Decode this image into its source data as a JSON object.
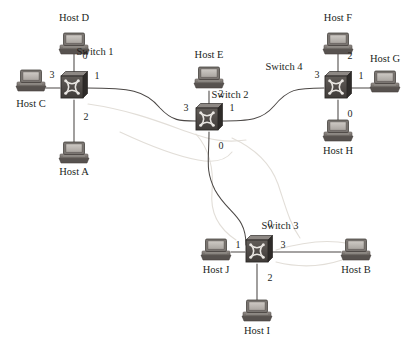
{
  "diagram": {
    "type": "network-topology",
    "colors": {
      "background": "#ffffff",
      "link": "#4b4745",
      "ghost_link": "#dedad4",
      "switch_face": "#55504d",
      "switch_top": "#8d8884",
      "switch_side": "#2e2b29",
      "switch_port_dot": "#e9e6e2",
      "host_screen_frame": "#6f6a66",
      "host_screen_fill": "#b9b4af",
      "host_base": "#8a8480",
      "host_base_shadow": "#57524f",
      "text": "#231f1d"
    },
    "switches": [
      {
        "id": "switch1",
        "label": "Switch 1",
        "x": 72,
        "y": 87,
        "label_x": 95,
        "label_y": 52
      },
      {
        "id": "switch2",
        "label": "Switch 2",
        "x": 207,
        "y": 119,
        "label_x": 230,
        "label_y": 95
      },
      {
        "id": "switch3",
        "label": "Switch 3",
        "x": 257,
        "y": 251,
        "label_x": 280,
        "label_y": 226
      },
      {
        "id": "switch4",
        "label": "Switch 4",
        "x": 336,
        "y": 87,
        "label_x": 284,
        "label_y": 67
      }
    ],
    "hosts": [
      {
        "id": "hostD",
        "label": "Host D",
        "x": 74,
        "y": 44,
        "label_x": 74,
        "label_y": 18,
        "orient": "down"
      },
      {
        "id": "hostC",
        "label": "Host C",
        "x": 31,
        "y": 81,
        "label_x": 31,
        "label_y": 104,
        "orient": "right"
      },
      {
        "id": "hostA",
        "label": "Host A",
        "x": 74,
        "y": 153,
        "label_x": 74,
        "label_y": 172,
        "orient": "up"
      },
      {
        "id": "hostE",
        "label": "Host E",
        "x": 209,
        "y": 78,
        "label_x": 209,
        "label_y": 55,
        "orient": "down"
      },
      {
        "id": "hostF",
        "label": "Host F",
        "x": 338,
        "y": 44,
        "label_x": 338,
        "label_y": 18,
        "orient": "down"
      },
      {
        "id": "hostG",
        "label": "Host G",
        "x": 385,
        "y": 82,
        "label_x": 385,
        "label_y": 59,
        "orient": "left"
      },
      {
        "id": "hostH",
        "label": "Host H",
        "x": 338,
        "y": 131,
        "label_x": 338,
        "label_y": 151,
        "orient": "up"
      },
      {
        "id": "hostJ",
        "label": "Host J",
        "x": 216,
        "y": 250,
        "label_x": 216,
        "label_y": 270,
        "orient": "right"
      },
      {
        "id": "hostB",
        "label": "Host B",
        "x": 356,
        "y": 250,
        "label_x": 356,
        "label_y": 270,
        "orient": "left"
      },
      {
        "id": "hostI",
        "label": "Host I",
        "x": 257,
        "y": 311,
        "label_x": 257,
        "label_y": 331,
        "orient": "up"
      }
    ],
    "ports": [
      {
        "switch": "switch1",
        "number": "0",
        "x": 85,
        "y": 56
      },
      {
        "switch": "switch1",
        "number": "3",
        "x": 52,
        "y": 75
      },
      {
        "switch": "switch1",
        "number": "1",
        "x": 97,
        "y": 76
      },
      {
        "switch": "switch1",
        "number": "2",
        "x": 86,
        "y": 117
      },
      {
        "switch": "switch2",
        "number": "2",
        "x": 221,
        "y": 94
      },
      {
        "switch": "switch2",
        "number": "3",
        "x": 186,
        "y": 108
      },
      {
        "switch": "switch2",
        "number": "1",
        "x": 232,
        "y": 108
      },
      {
        "switch": "switch2",
        "number": "0",
        "x": 221,
        "y": 146
      },
      {
        "switch": "switch4",
        "number": "2",
        "x": 350,
        "y": 56
      },
      {
        "switch": "switch4",
        "number": "3",
        "x": 317,
        "y": 75
      },
      {
        "switch": "switch4",
        "number": "1",
        "x": 361,
        "y": 76
      },
      {
        "switch": "switch4",
        "number": "0",
        "x": 350,
        "y": 114
      },
      {
        "switch": "switch3",
        "number": "0",
        "x": 270,
        "y": 224
      },
      {
        "switch": "switch3",
        "number": "1",
        "x": 238,
        "y": 245
      },
      {
        "switch": "switch3",
        "number": "3",
        "x": 283,
        "y": 245
      },
      {
        "switch": "switch3",
        "number": "2",
        "x": 270,
        "y": 278
      }
    ],
    "links": [
      {
        "id": "link-switch1-hostD",
        "from": "switch1:0",
        "to": "hostD",
        "shape": "line",
        "d": "M 74,52 L 74,79"
      },
      {
        "id": "link-switch1-hostC",
        "from": "switch1:3",
        "to": "hostC",
        "shape": "line",
        "d": "M 46,88 L 60,88"
      },
      {
        "id": "link-switch1-hostA",
        "from": "switch1:2",
        "to": "hostA",
        "shape": "line",
        "d": "M 74,100 L 74,147"
      },
      {
        "id": "link-switch1-switch2",
        "from": "switch1:1",
        "to": "switch2:3",
        "shape": "curve",
        "d": "M 86,88 C 130,88 145,90 160,108 C 172,121 180,121 196,121"
      },
      {
        "id": "link-switch2-hostE",
        "from": "switch2:2",
        "to": "hostE",
        "shape": "line",
        "d": "M 209,110 L 209,91"
      },
      {
        "id": "link-switch2-switch4",
        "from": "switch2:1",
        "to": "switch4:3",
        "shape": "curve",
        "d": "M 220,121 C 250,121 262,120 274,106 C 288,89 296,88 324,88"
      },
      {
        "id": "link-switch2-switch3",
        "from": "switch2:0",
        "to": "switch3:0",
        "shape": "curve",
        "d": "M 209,132 C 209,160 205,170 215,190 C 228,214 246,215 246,245"
      },
      {
        "id": "link-switch4-hostF",
        "from": "switch4:2",
        "to": "hostF",
        "shape": "line",
        "d": "M 338,52 L 338,79"
      },
      {
        "id": "link-switch4-hostG",
        "from": "switch4:1",
        "to": "hostG",
        "shape": "line",
        "d": "M 349,88 L 370,88"
      },
      {
        "id": "link-switch4-hostH",
        "from": "switch4:0",
        "to": "hostH",
        "shape": "line",
        "d": "M 338,100 L 338,125"
      },
      {
        "id": "link-switch3-hostJ",
        "from": "switch3:1",
        "to": "hostJ",
        "shape": "line",
        "d": "M 245,252 L 231,252"
      },
      {
        "id": "link-switch3-hostB",
        "from": "switch3:3",
        "to": "hostB",
        "shape": "line",
        "d": "M 269,252 L 341,252"
      },
      {
        "id": "link-switch3-hostI",
        "from": "switch3:2",
        "to": "hostI",
        "shape": "line",
        "d": "M 257,264 L 257,305"
      }
    ],
    "ghost_marks": [
      {
        "id": "ghost-1",
        "d": "M 88,104 C 130,110 160,122 188,132 C 210,140 226,143 246,140"
      },
      {
        "id": "ghost-2",
        "d": "M 120,132 C 150,146 176,156 198,160 C 214,163 226,160 232,152"
      },
      {
        "id": "ghost-3",
        "d": "M 196,134 C 210,150 214,170 212,192 C 210,212 218,228 236,240"
      },
      {
        "id": "ghost-4",
        "d": "M 232,138 C 254,148 270,162 278,184 C 286,208 290,224 300,238"
      },
      {
        "id": "ghost-5",
        "d": "M 276,250 C 296,244 318,240 338,242 C 350,243 356,246 358,250"
      },
      {
        "id": "ghost-6",
        "d": "M 276,262 C 300,268 324,266 342,260 C 352,257 356,254 358,252"
      }
    ]
  }
}
